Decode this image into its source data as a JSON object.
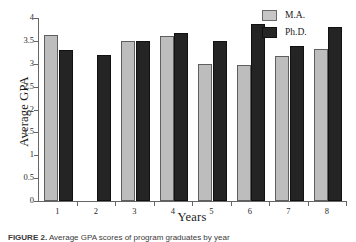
{
  "chart_data": {
    "type": "bar",
    "title": "",
    "xlabel": "Years",
    "ylabel": "Average GPA",
    "categories": [
      "1",
      "2",
      "3",
      "4",
      "5",
      "6",
      "7",
      "8"
    ],
    "ylim": [
      0,
      4
    ],
    "ytick_labels": [
      "0",
      "0.5",
      "1",
      "1.5",
      "2",
      "2.5",
      "3",
      "3.5",
      "4"
    ],
    "ytick_values": [
      0,
      0.5,
      1,
      1.5,
      2,
      2.5,
      3,
      3.5,
      4
    ],
    "grid": false,
    "legend_position": "top-right",
    "series": [
      {
        "name": "M.A.",
        "color": "#bdbdbd",
        "values": [
          3.62,
          null,
          3.5,
          3.6,
          2.99,
          2.98,
          3.17,
          3.32
        ]
      },
      {
        "name": "Ph.D.",
        "color": "#242424",
        "values": [
          3.31,
          3.2,
          3.5,
          3.68,
          3.49,
          3.88,
          3.38,
          3.8
        ]
      }
    ]
  },
  "legend": {
    "items": [
      {
        "label": "M.A.",
        "swatch": "ma"
      },
      {
        "label": "Ph.D.",
        "swatch": "phd"
      }
    ]
  },
  "caption": {
    "prefix": "FIGURE 2.",
    "text": "Average GPA scores of program graduates by year"
  }
}
